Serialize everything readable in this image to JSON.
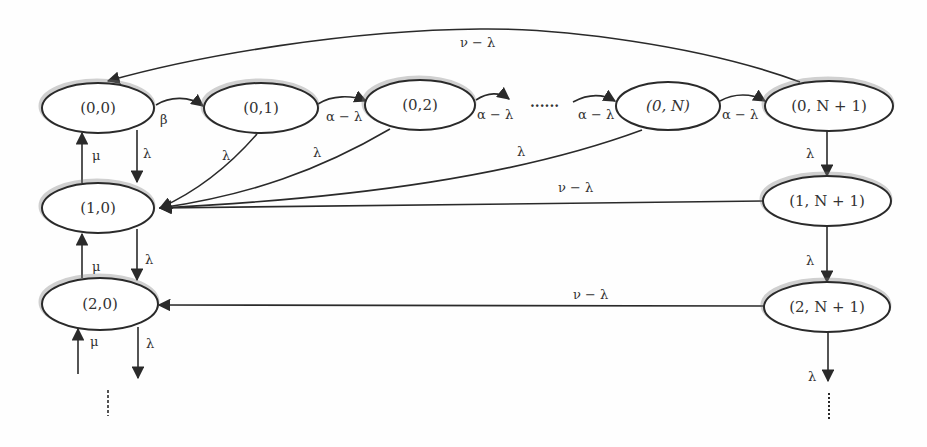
{
  "diagram": {
    "nodes": {
      "n00": {
        "label": "(0,0)"
      },
      "n01": {
        "label": "(0,1)"
      },
      "n02": {
        "label": "(0,2)"
      },
      "n0N": {
        "label": "(0, N)"
      },
      "n0N1": {
        "label": "(0, N + 1)"
      },
      "n10": {
        "label": "(1,0)"
      },
      "n20": {
        "label": "(2,0)"
      },
      "n1N1": {
        "label": "(1, N + 1)"
      },
      "n2N1": {
        "label": "(2, N + 1)"
      }
    },
    "edge_labels": {
      "top_return": "ν − λ",
      "n00_to_n01": "β",
      "n01_to_n02": "α − λ",
      "n02_to_dots": "α − λ",
      "dots_to_n0N": "α − λ",
      "n0N_to_n0N1": "α − λ",
      "n00_to_n10": "λ",
      "n10_to_n00": "μ",
      "n01_to_n10": "λ",
      "n02_to_n10": "λ",
      "n0N_to_n10": "λ",
      "n1N1_to_n10": "ν − λ",
      "n10_to_n20": "λ",
      "n20_to_n10": "μ",
      "n2N1_to_n20": "ν − λ",
      "n20_down": "λ",
      "n30_to_n20": "μ",
      "n0N1_to_n1N1": "λ",
      "n1N1_to_n2N1": "λ",
      "n2N1_down": "λ"
    },
    "ellipsis_horizontal": "......",
    "colors": {
      "stroke": "#2a2a2a",
      "text": "#333333",
      "background": "#fefefe"
    }
  }
}
